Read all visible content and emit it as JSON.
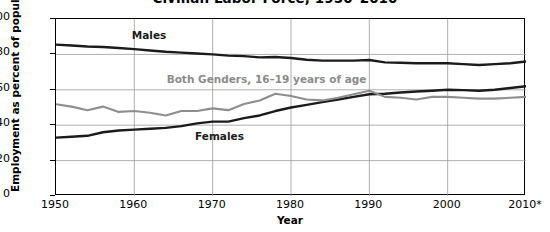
{
  "chart_data": {
    "type": "line",
    "title": "Civilian Labor Force, 1950–2010",
    "xlabel": "Year",
    "ylabel": "Employment as percent of population",
    "xlim": [
      1950,
      2010
    ],
    "ylim": [
      0,
      100
    ],
    "grid": true,
    "legend": "inline-labels",
    "xticklabels": [
      "1950",
      "1960",
      "1970",
      "1980",
      "1990",
      "2000",
      "2010*"
    ],
    "xtickvalues": [
      1950,
      1960,
      1970,
      1980,
      1990,
      2000,
      2010
    ],
    "yticklabels": [
      "0",
      "20",
      "40",
      "60",
      "80",
      "100"
    ],
    "ytickvalues": [
      0,
      20,
      40,
      60,
      80,
      100
    ],
    "footnote_marker": "*",
    "series": [
      {
        "name": "Males",
        "color": "#1b1b1b",
        "label_x": 1962,
        "label_y": 90,
        "x": [
          1950,
          1952,
          1954,
          1956,
          1958,
          1960,
          1962,
          1964,
          1966,
          1968,
          1970,
          1972,
          1974,
          1976,
          1978,
          1980,
          1982,
          1984,
          1986,
          1988,
          1990,
          1992,
          1994,
          1996,
          1998,
          2000,
          2002,
          2004,
          2006,
          2008,
          2010
        ],
        "values": [
          85.5,
          85.0,
          84.5,
          84.2,
          83.6,
          83.0,
          82.2,
          81.5,
          81.0,
          80.5,
          80.0,
          79.3,
          79.0,
          78.3,
          78.5,
          78.0,
          77.0,
          76.5,
          76.5,
          76.5,
          76.8,
          75.5,
          75.3,
          75.0,
          75.0,
          75.0,
          74.5,
          74.0,
          74.5,
          75.0,
          76.0
        ]
      },
      {
        "name": "Females",
        "color": "#1b1b1b",
        "label_x": 1971,
        "label_y": 33,
        "x": [
          1950,
          1952,
          1954,
          1956,
          1958,
          1960,
          1962,
          1964,
          1966,
          1968,
          1970,
          1972,
          1974,
          1976,
          1978,
          1980,
          1982,
          1984,
          1986,
          1988,
          1990,
          1992,
          1994,
          1996,
          1998,
          2000,
          2002,
          2004,
          2006,
          2008,
          2010
        ],
        "values": [
          33.0,
          33.5,
          34.0,
          36.0,
          37.0,
          37.5,
          38.0,
          38.5,
          39.5,
          41.0,
          42.0,
          42.0,
          44.0,
          45.5,
          48.0,
          50.0,
          51.5,
          53.0,
          54.5,
          56.0,
          57.5,
          57.8,
          58.5,
          59.0,
          59.5,
          60.0,
          59.8,
          59.5,
          60.0,
          61.0,
          62.0
        ]
      },
      {
        "name": "Both Genders, 16–19 years of age",
        "color": "#8e8e8e",
        "label_x": 1977,
        "label_y": 65,
        "x": [
          1950,
          1952,
          1954,
          1956,
          1958,
          1960,
          1962,
          1964,
          1966,
          1968,
          1970,
          1972,
          1974,
          1976,
          1978,
          1980,
          1982,
          1984,
          1986,
          1988,
          1990,
          1992,
          1994,
          1996,
          1998,
          2000,
          2002,
          2004,
          2006,
          2008,
          2010
        ],
        "values": [
          51.8,
          50.5,
          48.5,
          50.5,
          47.5,
          48.0,
          47.0,
          45.5,
          48.0,
          48.0,
          49.5,
          48.5,
          52.0,
          54.0,
          57.8,
          56.5,
          54.5,
          54.0,
          55.5,
          57.5,
          59.5,
          56.0,
          55.5,
          54.5,
          56.0,
          56.0,
          55.5,
          55.0,
          55.0,
          55.5,
          56.0
        ]
      }
    ]
  }
}
